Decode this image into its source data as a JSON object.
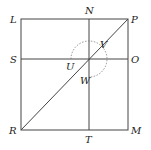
{
  "diagram": {
    "type": "square-with-bisectors-and-diagonal",
    "colors": {
      "line": "#444444",
      "dashed": "#777777",
      "label": "#222222"
    },
    "labels": {
      "L": "L",
      "N": "N",
      "P": "P",
      "S": "S",
      "U": "U",
      "V": "V",
      "O": "O",
      "W": "W",
      "R": "R",
      "T": "T",
      "M": "M"
    },
    "points": {
      "L": [
        21,
        19
      ],
      "N": [
        89,
        19
      ],
      "P": [
        128,
        19
      ],
      "S": [
        21,
        59
      ],
      "O": [
        128,
        59
      ],
      "R": [
        21,
        130
      ],
      "T": [
        89,
        130
      ],
      "M": [
        128,
        130
      ],
      "center": [
        89,
        59
      ]
    },
    "arc": {
      "style": "dashed",
      "radius": 18,
      "description": "dashed arc around center from U side over top through V to W"
    }
  }
}
